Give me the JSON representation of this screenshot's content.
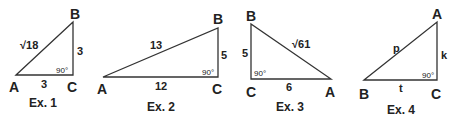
{
  "examples": [
    {
      "caption": "Ex. 1",
      "vertices": {
        "A": "A",
        "B": "B",
        "C": "C"
      },
      "sides": {
        "hyp": "√18",
        "vert": "3",
        "base": "3"
      },
      "angle": "90°"
    },
    {
      "caption": "Ex. 2",
      "vertices": {
        "A": "A",
        "B": "B",
        "C": "C"
      },
      "sides": {
        "hyp": "13",
        "vert": "5",
        "base": "12"
      },
      "angle": "90°"
    },
    {
      "caption": "Ex. 3",
      "vertices": {
        "A": "A",
        "B": "B",
        "C": "C"
      },
      "sides": {
        "hyp": "√61",
        "vert": "5",
        "base": "6"
      },
      "angle": "90°"
    },
    {
      "caption": "Ex. 4",
      "vertices": {
        "A": "A",
        "B": "B",
        "C": "C"
      },
      "sides": {
        "hyp": "p",
        "vert": "k",
        "base": "t"
      },
      "angle": "90°"
    }
  ]
}
